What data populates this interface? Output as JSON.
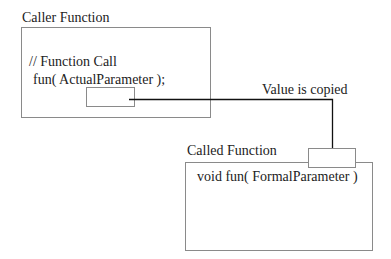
{
  "caller": {
    "title": "Caller Function",
    "comment": "// Function Call",
    "call": "fun( ActualParameter );"
  },
  "arrow": {
    "label": "Value is copied"
  },
  "called": {
    "title": "Called Function",
    "signature": "void fun( FormalParameter )"
  }
}
